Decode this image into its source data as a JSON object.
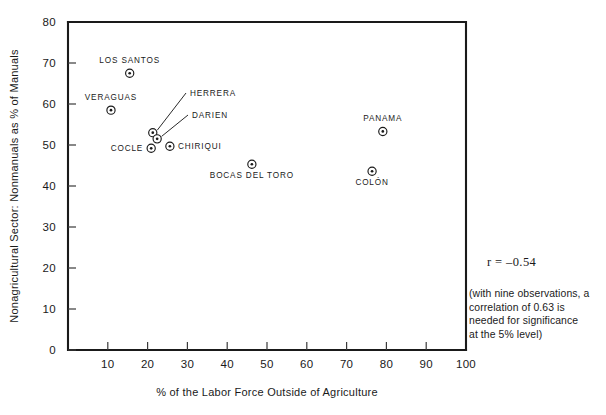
{
  "chart_data": {
    "type": "scatter",
    "title": "",
    "xlabel": "% of the Labor Force Outside of Agriculture",
    "ylabel": "Nonagricultural Sector: Nonmanuals as % of Manuals",
    "xlim": [
      0,
      100
    ],
    "ylim": [
      0,
      80
    ],
    "xticks": [
      0,
      10,
      20,
      30,
      40,
      50,
      60,
      70,
      80,
      90,
      100
    ],
    "yticks": [
      0,
      10,
      20,
      30,
      40,
      50,
      60,
      70,
      80
    ],
    "xtick_labels": [
      "0",
      "10",
      "20",
      "30",
      "40",
      "50",
      "60",
      "70",
      "80",
      "90",
      "100"
    ],
    "ytick_labels": [
      "0",
      "10",
      "20",
      "30",
      "40",
      "50",
      "60",
      "70",
      "80"
    ],
    "grid": false,
    "legend": "none",
    "points": [
      {
        "label": "LOS SANTOS",
        "x": 15.5,
        "y": 67.5,
        "label_pos": "above",
        "leader": false
      },
      {
        "label": "VERAGUAS",
        "x": 10.8,
        "y": 58.5,
        "label_pos": "above",
        "leader": false
      },
      {
        "label": "HERRERA",
        "x": 21.3,
        "y": 53.0,
        "label_pos": "leader",
        "leader": true
      },
      {
        "label": "DARIEN",
        "x": 22.4,
        "y": 51.5,
        "label_pos": "leader",
        "leader": true
      },
      {
        "label": "COCLE",
        "x": 20.9,
        "y": 49.2,
        "label_pos": "left",
        "leader": false
      },
      {
        "label": "CHIRIQUI",
        "x": 25.6,
        "y": 49.7,
        "label_pos": "right",
        "leader": false
      },
      {
        "label": "BOCAS DEL TORO",
        "x": 46.2,
        "y": 45.3,
        "label_pos": "below",
        "leader": false
      },
      {
        "label": "PANAMA",
        "x": 79.1,
        "y": 53.3,
        "label_pos": "above",
        "leader": false
      },
      {
        "label": "COLON",
        "x": 76.4,
        "y": 43.6,
        "label_pos": "below",
        "leader": false
      }
    ],
    "annotations": {
      "correlation": "r = –0.54",
      "significance_note": "(with nine observations, a correlation of 0.63 is needed for significance at the 5% level)"
    }
  },
  "annotation": {
    "correlation_text": "r = –0.54",
    "note_line_1": "(with nine observations, a",
    "note_line_2": "correlation of 0.63 is",
    "note_line_3": "needed for significance",
    "note_line_4": "at the 5% level)"
  },
  "axes": {
    "x_title": "% of the Labor Force Outside of Agriculture",
    "y_title": "Nonagricultural Sector: Nonmanuals as % of Manuals"
  }
}
